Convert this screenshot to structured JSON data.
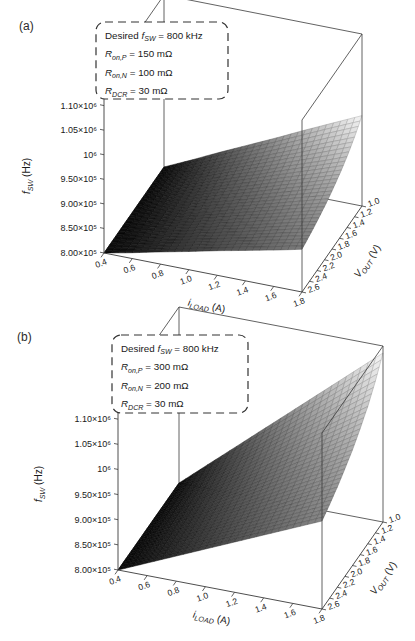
{
  "figure": {
    "background": "#ffffff",
    "colors": {
      "surface_low": "#0c0c0c",
      "surface_high": "#f7f7f7",
      "box_edge": "#3a3a3a",
      "text": "#1a1a1a"
    }
  },
  "chart_data": [
    {
      "type": "surface",
      "panel_label": "(a)",
      "annotation": {
        "lines_text": [
          "Desired f_SW = 800 kHz",
          "R_on,P = 150 mΩ",
          "R_on,N = 100 mΩ",
          "R_DCR = 30 mΩ"
        ],
        "lines_segments": [
          [
            {
              "t": "Desired "
            },
            {
              "t": "f",
              "i": true
            },
            {
              "t": "SW",
              "sub": true,
              "i": true
            },
            {
              "t": " = 800 kHz"
            }
          ],
          [
            {
              "t": "R",
              "i": true
            },
            {
              "t": "on,P",
              "sub": true,
              "i": true
            },
            {
              "t": " = 150 mΩ"
            }
          ],
          [
            {
              "t": "R",
              "i": true
            },
            {
              "t": "on,N",
              "sub": true,
              "i": true
            },
            {
              "t": " = 100 mΩ"
            }
          ],
          [
            {
              "t": "R",
              "i": true
            },
            {
              "t": "DCR",
              "sub": true,
              "i": true
            },
            {
              "t": " = 30 mΩ"
            }
          ]
        ]
      },
      "x_axis": {
        "label_text": "i_LOAD (A)",
        "label_segments": [
          {
            "t": "i",
            "i": true
          },
          {
            "t": "LOAD",
            "sub": true,
            "i": true
          },
          {
            "t": " (A)"
          }
        ],
        "tick_labels": [
          "0.4",
          "0.6",
          "0.8",
          "1.0",
          "1.2",
          "1.4",
          "1.6",
          "1.8"
        ],
        "tick_values": [
          0.4,
          0.6,
          0.8,
          1.0,
          1.2,
          1.4,
          1.6,
          1.8
        ],
        "range": [
          0.4,
          1.8
        ]
      },
      "y_axis": {
        "label_text": "V_OUT (V)",
        "label_segments": [
          {
            "t": "V",
            "i": true
          },
          {
            "t": "OUT",
            "sub": true,
            "i": true
          },
          {
            "t": " (V)"
          }
        ],
        "tick_labels": [
          "1.0",
          "1.2",
          "1.4",
          "1.6",
          "1.8",
          "2.0",
          "2.2",
          "2.4",
          "2.6"
        ],
        "tick_values": [
          1.0,
          1.2,
          1.4,
          1.6,
          1.8,
          2.0,
          2.2,
          2.4,
          2.6
        ],
        "range": [
          1.0,
          2.6
        ]
      },
      "z_axis": {
        "label_text": "f_SW (Hz)",
        "label_segments": [
          {
            "t": "f",
            "i": true
          },
          {
            "t": "SW",
            "sub": true,
            "i": true
          },
          {
            "t": " (Hz)"
          }
        ],
        "tick_labels": [
          "8.00×10⁵",
          "8.50×10⁵",
          "9.00×10⁵",
          "9.50×10⁵",
          "10⁶",
          "1.05×10⁶",
          "1.10×10⁶"
        ],
        "tick_values": [
          800000,
          850000,
          900000,
          950000,
          1000000,
          1050000,
          1100000
        ],
        "lim": [
          800000,
          1150000
        ]
      },
      "surface_grid": {
        "note": "z values in Hz; rows = V_OUT 1.0→2.6, cols = i_LOAD 0.4→1.8",
        "z_hz": [
          [
            800000,
            826000,
            853000,
            879000,
            905000,
            932000,
            958000,
            984000
          ],
          [
            800000,
            823000,
            846000,
            869000,
            892000,
            915000,
            939000,
            962000
          ],
          [
            800000,
            821000,
            841000,
            862000,
            882000,
            903000,
            923000,
            944000
          ],
          [
            800000,
            819000,
            837000,
            856000,
            874000,
            893000,
            911000,
            930000
          ],
          [
            800000,
            817000,
            834000,
            851000,
            867000,
            884000,
            901000,
            918000
          ],
          [
            800000,
            815000,
            831000,
            846000,
            862000,
            877000,
            893000,
            908000
          ],
          [
            800000,
            814000,
            829000,
            843000,
            857000,
            871000,
            886000,
            900000
          ],
          [
            800000,
            813000,
            827000,
            840000,
            853000,
            866000,
            880000,
            893000
          ],
          [
            800000,
            812000,
            825000,
            837000,
            850000,
            862000,
            874000,
            887000
          ]
        ]
      },
      "colormap": "grayscale, dark = low f_SW, light = high f_SW",
      "legend": "none",
      "grid": "mesh on surface, open box axes"
    },
    {
      "type": "surface",
      "panel_label": "(b)",
      "annotation": {
        "lines_text": [
          "Desired f_SW = 800 kHz",
          "R_on,P = 300 mΩ",
          "R_on,N = 200 mΩ",
          "R_DCR = 30 mΩ"
        ],
        "lines_segments": [
          [
            {
              "t": "Desired "
            },
            {
              "t": "f",
              "i": true
            },
            {
              "t": "SW",
              "sub": true,
              "i": true
            },
            {
              "t": " = 800 kHz"
            }
          ],
          [
            {
              "t": "R",
              "i": true
            },
            {
              "t": "on,P",
              "sub": true,
              "i": true
            },
            {
              "t": " = 300 mΩ"
            }
          ],
          [
            {
              "t": "R",
              "i": true
            },
            {
              "t": "on,N",
              "sub": true,
              "i": true
            },
            {
              "t": " = 200 mΩ"
            }
          ],
          [
            {
              "t": "R",
              "i": true
            },
            {
              "t": "DCR",
              "sub": true,
              "i": true
            },
            {
              "t": " = 30 mΩ"
            }
          ]
        ]
      },
      "x_axis": {
        "label_text": "i_LOAD (A)",
        "label_segments": [
          {
            "t": "i",
            "i": true
          },
          {
            "t": "LOAD",
            "sub": true,
            "i": true
          },
          {
            "t": " (A)"
          }
        ],
        "tick_labels": [
          "0.4",
          "0.6",
          "0.8",
          "1.0",
          "1.2",
          "1.4",
          "1.6",
          "1.8"
        ],
        "tick_values": [
          0.4,
          0.6,
          0.8,
          1.0,
          1.2,
          1.4,
          1.6,
          1.8
        ],
        "range": [
          0.4,
          1.8
        ]
      },
      "y_axis": {
        "label_text": "V_OUT (V)",
        "label_segments": [
          {
            "t": "V",
            "i": true
          },
          {
            "t": "OUT",
            "sub": true,
            "i": true
          },
          {
            "t": " (V)"
          }
        ],
        "tick_labels": [
          "1.0",
          "1.2",
          "1.4",
          "1.6",
          "1.8",
          "2.0",
          "2.2",
          "2.4",
          "2.6"
        ],
        "tick_values": [
          1.0,
          1.2,
          1.4,
          1.6,
          1.8,
          2.0,
          2.2,
          2.4,
          2.6
        ],
        "range": [
          1.0,
          2.6
        ]
      },
      "z_axis": {
        "label_text": "f_SW (Hz)",
        "label_segments": [
          {
            "t": "f",
            "i": true
          },
          {
            "t": "SW",
            "sub": true,
            "i": true
          },
          {
            "t": " (Hz)"
          }
        ],
        "tick_labels": [
          "8.00×10⁵",
          "8.50×10⁵",
          "9.00×10⁵",
          "9.50×10⁵",
          "10⁶",
          "1.05×10⁶",
          "1.10×10⁶"
        ],
        "tick_values": [
          800000,
          850000,
          900000,
          950000,
          1000000,
          1050000,
          1100000
        ],
        "lim": [
          800000,
          1150000
        ]
      },
      "surface_grid": {
        "note": "z values in Hz; rows = V_OUT 1.0→2.6, cols = i_LOAD 0.4→1.8",
        "z_hz": [
          [
            800000,
            848000,
            896000,
            944000,
            992000,
            1040000,
            1088000,
            1136000
          ],
          [
            800000,
            843000,
            886000,
            929000,
            972000,
            1015000,
            1059000,
            1102000
          ],
          [
            800000,
            839000,
            878000,
            917000,
            956000,
            995000,
            1034000,
            1073000
          ],
          [
            800000,
            836000,
            871000,
            907000,
            943000,
            979000,
            1014000,
            1050000
          ],
          [
            800000,
            833000,
            866000,
            899000,
            932000,
            965000,
            997000,
            1030000
          ],
          [
            800000,
            831000,
            861000,
            892000,
            922000,
            953000,
            983000,
            1014000
          ],
          [
            800000,
            828000,
            857000,
            885000,
            914000,
            942000,
            971000,
            999000
          ],
          [
            800000,
            827000,
            853000,
            880000,
            906000,
            933000,
            960000,
            986000
          ],
          [
            800000,
            825000,
            850000,
            875000,
            900000,
            925000,
            950000,
            975000
          ]
        ]
      },
      "colormap": "grayscale, dark = low f_SW, light = high f_SW",
      "legend": "none",
      "grid": "mesh on surface, open box axes"
    }
  ]
}
